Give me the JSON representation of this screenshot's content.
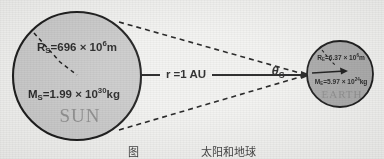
{
  "figure": {
    "background_color": "#f2f2f0",
    "caption": "图   　　　　　 太阳和地球"
  },
  "sun": {
    "name_label": "SUN",
    "radius_label": {
      "prefix": "R",
      "subscript": "S",
      "eq": "=696",
      "times": " × 10",
      "exponent": "6",
      "unit": "m",
      "full": "R_S=696 × 10^6 m"
    },
    "mass_label": {
      "prefix": "M",
      "subscript": "S",
      "eq": "=1.99",
      "times": " × 10",
      "exponent": "30",
      "unit": "kg",
      "full": "M_S=1.99 × 10^30 kg"
    },
    "fill_color": "#c9c9c9",
    "stroke_color": "#1a1a1a",
    "center_x": 77,
    "center_y": 76,
    "radius": 64
  },
  "earth": {
    "name_label": "EARTH",
    "radius_label": {
      "prefix": "R",
      "subscript": "E",
      "eq": "=6.37",
      "times": " × 10",
      "exponent": "6",
      "unit": "m",
      "full": "R_E=6.37 × 10^6 m"
    },
    "mass_label": {
      "prefix": "M",
      "subscript": "E",
      "eq": "=5.97",
      "times": " × 10",
      "exponent": "24",
      "unit": "kg",
      "full": "M_E=5.97 × 10^24 kg"
    },
    "fill_color": "#a8a8a8",
    "stroke_color": "#1a1a1a",
    "center_x": 340,
    "center_y": 74,
    "radius": 33
  },
  "distance": {
    "label": "r =1 AU",
    "line_color": "#1a1a1a"
  },
  "angle": {
    "symbol": "θ",
    "subscript": "S",
    "full": "θ_S"
  }
}
